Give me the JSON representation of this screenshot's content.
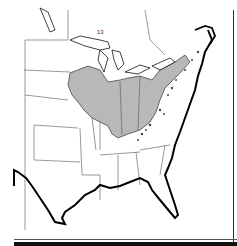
{
  "map": {
    "title": "",
    "region": "Eastern United States",
    "colors": {
      "background": "#ffffff",
      "outline": "#222222",
      "coast": "#000000",
      "shaded_region": "#b8b8b8",
      "state_lines": "#555555"
    },
    "labels": {
      "lake_marker": "13"
    },
    "legend": []
  }
}
